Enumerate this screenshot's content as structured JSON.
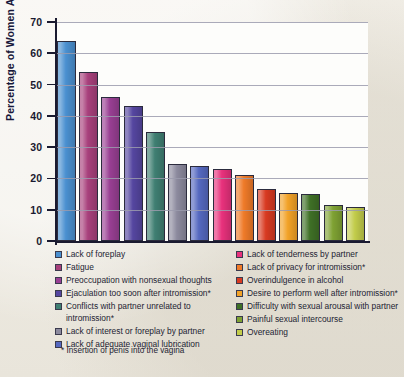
{
  "chart_data": {
    "type": "bar",
    "title": "",
    "xlabel": "",
    "ylabel": "Percentage of Women Affected",
    "ylim": [
      0,
      70
    ],
    "yticks": [
      0,
      10,
      20,
      30,
      40,
      50,
      60,
      70
    ],
    "grid": true,
    "legend_position": "below",
    "categories": [
      "Lack of foreplay",
      "Fatigue",
      "Preoccupation with nonsexual thoughts",
      "Ejaculation too soon after intromission*",
      "Conflicts with partner unrelated to intromission*",
      "Lack of interest or foreplay by partner",
      "Lack of adequate vaginal lubrication",
      "Lack of tenderness by partner",
      "Lack of privacy for intromission*",
      "Overindulgence in alcohol",
      "Desire to perform well after intromission*",
      "Difficulty with sexual arousal with partner",
      "Painful sexual intercourse",
      "Overeating"
    ],
    "values": [
      64,
      54,
      46,
      43,
      35,
      24.5,
      24,
      23,
      21,
      16.5,
      15.5,
      15,
      11.5,
      11
    ],
    "colors": [
      "#4a90d0",
      "#a8407c",
      "#993f93",
      "#5546a0",
      "#3f7f72",
      "#8c8a9e",
      "#5568c0",
      "#e8317c",
      "#ef7a28",
      "#d83a21",
      "#f2a227",
      "#3f7026",
      "#7fa233",
      "#c2cc4a"
    ],
    "footnote": "* Insertion of penis into the vagina"
  },
  "legend": {
    "left_column": [
      {
        "label": "Lack of foreplay",
        "color": "#4a90d0"
      },
      {
        "label": "Fatigue",
        "color": "#a8407c"
      },
      {
        "label": "Preoccupation with nonsexual thoughts",
        "color": "#993f93"
      },
      {
        "label": "Ejaculation too soon after intromission*",
        "color": "#5546a0"
      },
      {
        "label": "Conflicts with partner unrelated to intromission*",
        "color": "#3f7f72"
      },
      {
        "label": "Lack of interest or foreplay by partner",
        "color": "#8c8a9e"
      },
      {
        "label": "Lack of adequate vaginal lubrication",
        "color": "#5568c0"
      }
    ],
    "right_column": [
      {
        "label": "Lack of tenderness by partner",
        "color": "#e8317c"
      },
      {
        "label": "Lack of privacy for intromission*",
        "color": "#ef7a28"
      },
      {
        "label": "Overindulgence in alcohol",
        "color": "#d83a21"
      },
      {
        "label": "Desire to perform well after intromission*",
        "color": "#f2a227"
      },
      {
        "label": "Difficulty with sexual arousal with partner",
        "color": "#3f7026"
      },
      {
        "label": "Painful sexual intercourse",
        "color": "#7fa233"
      },
      {
        "label": "Overeating",
        "color": "#c2cc4a"
      }
    ]
  }
}
